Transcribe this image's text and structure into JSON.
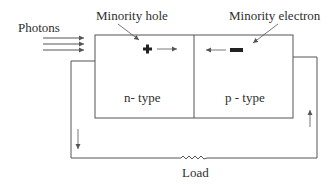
{
  "diagram": {
    "labels": {
      "photons": "Photons",
      "minority_hole": "Minority hole",
      "minority_electron": "Minority electron",
      "n_type": "n- type",
      "p_type": "p - type",
      "load": "Load"
    },
    "symbols": {
      "hole": "+",
      "electron": "−"
    },
    "colors": {
      "line": "#555555",
      "text": "#2e2e2e",
      "background": "#ffffff"
    }
  }
}
